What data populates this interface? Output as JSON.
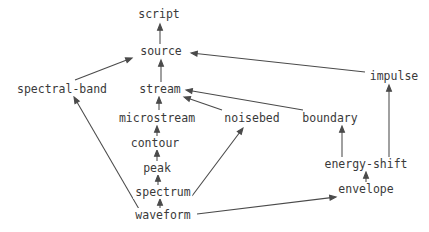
{
  "diagram": {
    "title": "",
    "type": "directed-acyclic-graph",
    "stroke_color": "#4a4a4a",
    "text_color": "#3a3a3a",
    "background_color": "#ffffff",
    "nodes": [
      {
        "id": "script",
        "label": "script",
        "x": 159,
        "y": 14
      },
      {
        "id": "source",
        "label": "source",
        "x": 161,
        "y": 51
      },
      {
        "id": "spectral-band",
        "label": "spectral-band",
        "x": 62,
        "y": 89
      },
      {
        "id": "stream",
        "label": "stream",
        "x": 160,
        "y": 89
      },
      {
        "id": "impulse",
        "label": "impulse",
        "x": 394,
        "y": 76
      },
      {
        "id": "microstream",
        "label": "microstream",
        "x": 157,
        "y": 118
      },
      {
        "id": "noisebed",
        "label": "noisebed",
        "x": 252,
        "y": 118
      },
      {
        "id": "boundary",
        "label": "boundary",
        "x": 330,
        "y": 118
      },
      {
        "id": "contour",
        "label": "contour",
        "x": 155,
        "y": 143
      },
      {
        "id": "energy-shift",
        "label": "energy-shift",
        "x": 366,
        "y": 164
      },
      {
        "id": "peak",
        "label": "peak",
        "x": 157,
        "y": 168
      },
      {
        "id": "spectrum",
        "label": "spectrum",
        "x": 163,
        "y": 192
      },
      {
        "id": "envelope",
        "label": "envelope",
        "x": 366,
        "y": 189
      },
      {
        "id": "waveform",
        "label": "waveform",
        "x": 163,
        "y": 215
      }
    ],
    "edges": [
      {
        "from": "source",
        "to": "script",
        "x1": 160,
        "y1": 44,
        "x2": 160,
        "y2": 24
      },
      {
        "from": "stream",
        "to": "source",
        "x1": 161,
        "y1": 82,
        "x2": 161,
        "y2": 60
      },
      {
        "from": "spectral-band",
        "to": "source",
        "x1": 75,
        "y1": 80,
        "x2": 132,
        "y2": 58
      },
      {
        "from": "impulse",
        "to": "source",
        "x1": 365,
        "y1": 72,
        "x2": 191,
        "y2": 53
      },
      {
        "from": "microstream",
        "to": "stream",
        "x1": 159,
        "y1": 110,
        "x2": 159,
        "y2": 97
      },
      {
        "from": "noisebed",
        "to": "stream",
        "x1": 222,
        "y1": 110,
        "x2": 184,
        "y2": 97
      },
      {
        "from": "boundary",
        "to": "stream",
        "x1": 303,
        "y1": 110,
        "x2": 186,
        "y2": 90
      },
      {
        "from": "contour",
        "to": "microstream",
        "x1": 157,
        "y1": 136,
        "x2": 157,
        "y2": 126
      },
      {
        "from": "peak",
        "to": "contour",
        "x1": 157,
        "y1": 161,
        "x2": 157,
        "y2": 150
      },
      {
        "from": "spectrum",
        "to": "peak",
        "x1": 158,
        "y1": 185,
        "x2": 158,
        "y2": 175
      },
      {
        "from": "waveform",
        "to": "spectrum",
        "x1": 160,
        "y1": 208,
        "x2": 160,
        "y2": 199
      },
      {
        "from": "spectrum",
        "to": "noisebed",
        "x1": 192,
        "y1": 196,
        "x2": 243,
        "y2": 128
      },
      {
        "from": "waveform",
        "to": "spectral-band",
        "x1": 139,
        "y1": 209,
        "x2": 74,
        "y2": 97
      },
      {
        "from": "waveform",
        "to": "envelope",
        "x1": 197,
        "y1": 214,
        "x2": 336,
        "y2": 197
      },
      {
        "from": "envelope",
        "to": "energy-shift",
        "x1": 366,
        "y1": 182,
        "x2": 366,
        "y2": 172
      },
      {
        "from": "energy-shift",
        "to": "boundary",
        "x1": 342,
        "y1": 157,
        "x2": 342,
        "y2": 126
      },
      {
        "from": "energy-shift",
        "to": "impulse",
        "x1": 389,
        "y1": 157,
        "x2": 389,
        "y2": 85
      }
    ]
  }
}
